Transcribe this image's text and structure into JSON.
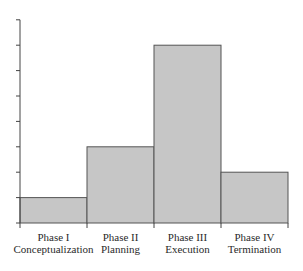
{
  "chart_data": {
    "type": "bar",
    "title": "",
    "xlabel": "",
    "ylabel": "",
    "categories": [
      {
        "line1": "Phase I",
        "line2": "Conceptualization"
      },
      {
        "line1": "Phase II",
        "line2": "Planning"
      },
      {
        "line1": "Phase III",
        "line2": "Execution"
      },
      {
        "line1": "Phase IV",
        "line2": "Termination"
      }
    ],
    "values": [
      1,
      3,
      7,
      2
    ],
    "ylim": [
      0,
      8
    ],
    "y_ticks": [
      0,
      1,
      2,
      3,
      4,
      5,
      6,
      7,
      8
    ],
    "y_tick_labels_shown": false,
    "grid": false,
    "legend": null,
    "bar_fill": "#c6c6c6",
    "bar_stroke": "#555555",
    "axis_color": "#444444"
  }
}
